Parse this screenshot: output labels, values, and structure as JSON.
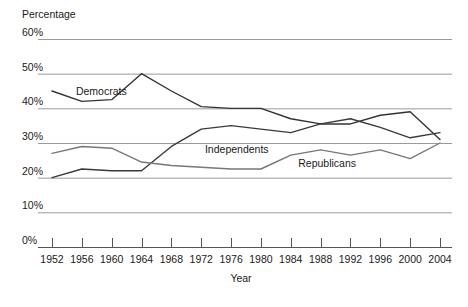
{
  "chart_data": {
    "type": "line",
    "title": "",
    "xlabel": "Year",
    "ylabel": "Percentage",
    "x": [
      1952,
      1956,
      1960,
      1964,
      1968,
      1972,
      1976,
      1980,
      1984,
      1988,
      1992,
      1996,
      2000,
      2004
    ],
    "xlim": [
      1952,
      2004
    ],
    "ylim": [
      0,
      60
    ],
    "ytick_labels": [
      "0%",
      "10%",
      "20%",
      "30%",
      "40%",
      "50%",
      "60%"
    ],
    "ytick_values": [
      0,
      10,
      20,
      30,
      40,
      50,
      60
    ],
    "xtick_labels": [
      "1952",
      "1956",
      "1960",
      "1964",
      "1968",
      "1972",
      "1976",
      "1980",
      "1984",
      "1988",
      "1992",
      "1996",
      "2000",
      "2004"
    ],
    "grid": true,
    "grid_color": "#9a9a9a",
    "axis_color": "#555555",
    "legend": "inline-labels",
    "series": [
      {
        "name": "Democrats",
        "label": "Democrats",
        "color": "#333333",
        "label_x": 1955.2,
        "label_y": 44.6,
        "values": [
          45.0,
          42.0,
          42.5,
          50.0,
          45.0,
          40.5,
          40.0,
          40.0,
          37.0,
          35.5,
          35.5,
          38.0,
          39.0,
          31.0
        ]
      },
      {
        "name": "Independents",
        "label": "Independents",
        "color": "#3a3a3a",
        "label_x": 1972.5,
        "label_y": 28.0,
        "values": [
          20.0,
          22.5,
          22.0,
          22.0,
          29.0,
          34.0,
          35.0,
          34.0,
          33.0,
          35.5,
          37.0,
          34.5,
          31.5,
          33.0
        ]
      },
      {
        "name": "Republicans",
        "label": "Republicans",
        "color": "#777777",
        "label_x": 1985.0,
        "label_y": 24.0,
        "values": [
          27.0,
          29.0,
          28.5,
          24.5,
          23.5,
          23.0,
          22.5,
          22.5,
          26.5,
          28.0,
          26.5,
          28.0,
          25.5,
          30.0
        ]
      }
    ]
  },
  "axes": {
    "y_title": "Percentage",
    "x_title": "Year"
  }
}
